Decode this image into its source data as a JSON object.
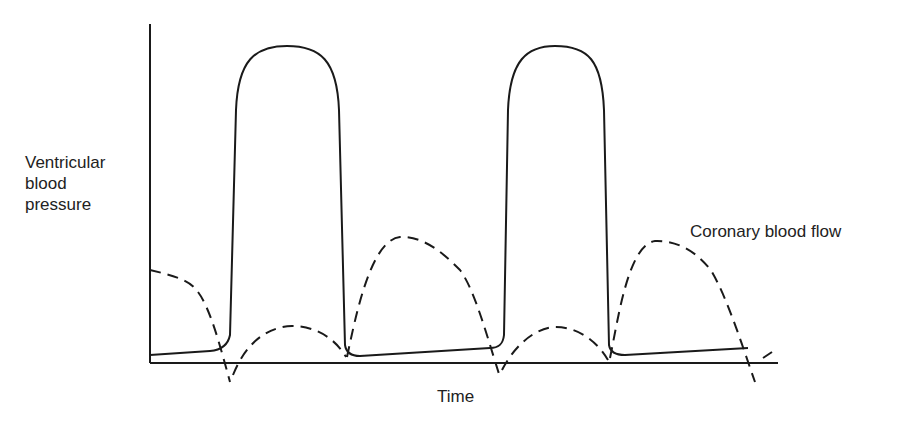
{
  "chart_data": {
    "type": "line",
    "title": "",
    "xlabel": "Time",
    "ylabel_lines": [
      "Ventricular",
      "blood",
      "pressure"
    ],
    "grid": false,
    "axes": {
      "x_axis": {
        "x1": 150,
        "x2": 778,
        "y": 363
      },
      "y_axis": {
        "x": 150,
        "y1": 24,
        "y2": 363
      }
    },
    "series": [
      {
        "name": "Ventricular blood pressure",
        "style": "solid",
        "path": "M150,355 L210,351 C222,350 228,345 230,335 L236,110 C238,60 255,46 287,46 C320,46 337,60 339,110 L345,345 C346,352 350,356 360,356 L490,348 C498,348 503,345 504,335 L508,110 C510,60 527,46 555,46 C588,46 602,60 604,110 L609,345 C610,351 615,355 625,355 L748,348"
      },
      {
        "name": "Coronary blood flow",
        "style": "dashed",
        "path": "M150,270 C175,276 190,280 198,292 C210,308 220,345 230,382 M233,375 C245,345 265,327 292,326 C315,326 335,338 346,357 M347,357 C355,320 370,240 400,237 C425,236 445,255 460,270 C475,290 488,340 500,377 M502,370 C515,345 535,328 555,327 C580,327 598,343 608,360 M610,358 C618,320 628,245 655,241 C680,240 700,255 712,272 C728,300 742,345 755,382 M763,358 L772,352"
      }
    ],
    "annotations": [
      {
        "text": "Coronary blood flow",
        "x": 690,
        "y": 221
      }
    ]
  }
}
